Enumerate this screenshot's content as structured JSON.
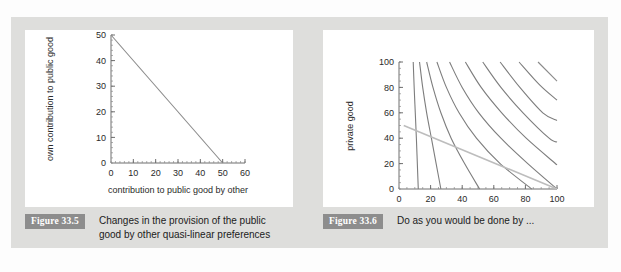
{
  "page": {
    "background_color": "#fdfdfd",
    "panel_color": "#dededc",
    "card_color": "#ffffff",
    "badge_color": "#8d8d8d"
  },
  "figures": [
    {
      "badge": "Figure 33.5",
      "caption_line_1": "Changes in the provision of the public",
      "caption_line_2": "good by other quasi-linear preferences"
    },
    {
      "badge": "Figure 33.6",
      "caption_line_1": "Do as you would be done by ...",
      "caption_line_2": ""
    }
  ],
  "chart_data": [
    {
      "type": "line",
      "title": "",
      "xlabel": "contribution to public good by other",
      "ylabel": "own contribution to public good",
      "xlim": [
        0,
        60
      ],
      "ylim": [
        0,
        50
      ],
      "xticks": [
        0,
        10,
        20,
        30,
        40,
        50,
        60
      ],
      "yticks": [
        0,
        10,
        20,
        30,
        40,
        50
      ],
      "xtick_labels": [
        "0",
        "10",
        "20",
        "30",
        "40",
        "50",
        "60"
      ],
      "ytick_labels": [
        "0",
        "10",
        "20",
        "30",
        "40",
        "50"
      ],
      "minor_tick_step_x": 2,
      "minor_tick_step_y": 2,
      "grid": false,
      "legend": null,
      "series": [
        {
          "name": "own contribution best response",
          "color": "#8a8a8a",
          "x": [
            0,
            50
          ],
          "y": [
            50,
            0
          ]
        }
      ]
    },
    {
      "type": "line",
      "title": "",
      "xlabel": "public good",
      "ylabel": "private good",
      "xlim": [
        0,
        100
      ],
      "ylim": [
        0,
        100
      ],
      "xticks": [
        0,
        20,
        40,
        60,
        80,
        100
      ],
      "yticks": [
        0,
        20,
        40,
        60,
        80,
        100
      ],
      "xtick_labels": [
        "0",
        "20",
        "40",
        "60",
        "80",
        "100"
      ],
      "ytick_labels": [
        "0",
        "20",
        "40",
        "60",
        "80",
        "100"
      ],
      "minor_tick_step_x": 5,
      "minor_tick_step_y": 5,
      "grid": false,
      "legend": null,
      "series": [
        {
          "name": "indifference curve 1",
          "color": "#7d7d7d",
          "x": [
            9,
            9.6,
            10.3,
            11,
            11.6,
            12.2
          ],
          "y": [
            100,
            80,
            60,
            40,
            20,
            0
          ]
        },
        {
          "name": "indifference curve 2",
          "color": "#7d7d7d",
          "x": [
            13,
            15,
            17.5,
            20.5,
            23.5,
            26.5
          ],
          "y": [
            100,
            80,
            60,
            40,
            20,
            0
          ]
        },
        {
          "name": "indifference curve 3",
          "color": "#7d7d7d",
          "x": [
            17.5,
            21.5,
            26.5,
            33,
            41.5,
            51
          ],
          "y": [
            100,
            80,
            60,
            40,
            20,
            0
          ]
        },
        {
          "name": "indifference curve 4",
          "color": "#7d7d7d",
          "x": [
            24,
            30,
            38,
            49,
            64,
            84
          ],
          "y": [
            100,
            80,
            60,
            40,
            20,
            0
          ]
        },
        {
          "name": "indifference curve 5",
          "color": "#7d7d7d",
          "x": [
            32,
            40,
            50.5,
            64.5,
            81.5,
            100
          ],
          "y": [
            100,
            80,
            60,
            40,
            20,
            0
          ]
        },
        {
          "name": "indifference curve 6",
          "color": "#7d7d7d",
          "x": [
            42,
            52,
            65,
            80.5,
            100
          ],
          "y": [
            100,
            80,
            60,
            40,
            19
          ]
        },
        {
          "name": "indifference curve 7",
          "color": "#7d7d7d",
          "x": [
            53,
            64.5,
            78.5,
            95,
            100
          ],
          "y": [
            100,
            80,
            60,
            40,
            37
          ]
        },
        {
          "name": "indifference curve 8",
          "color": "#7d7d7d",
          "x": [
            64,
            76.5,
            91,
            100
          ],
          "y": [
            100,
            80,
            60,
            54
          ]
        },
        {
          "name": "indifference curve 9",
          "color": "#7d7d7d",
          "x": [
            76,
            89,
            100
          ],
          "y": [
            100,
            82,
            70
          ]
        },
        {
          "name": "indifference curve 10",
          "color": "#7d7d7d",
          "x": [
            88,
            100
          ],
          "y": [
            100,
            85
          ]
        },
        {
          "name": "budget line",
          "color": "#bdbdbd",
          "x": [
            3,
            100
          ],
          "y": [
            50,
            0
          ]
        }
      ]
    }
  ]
}
